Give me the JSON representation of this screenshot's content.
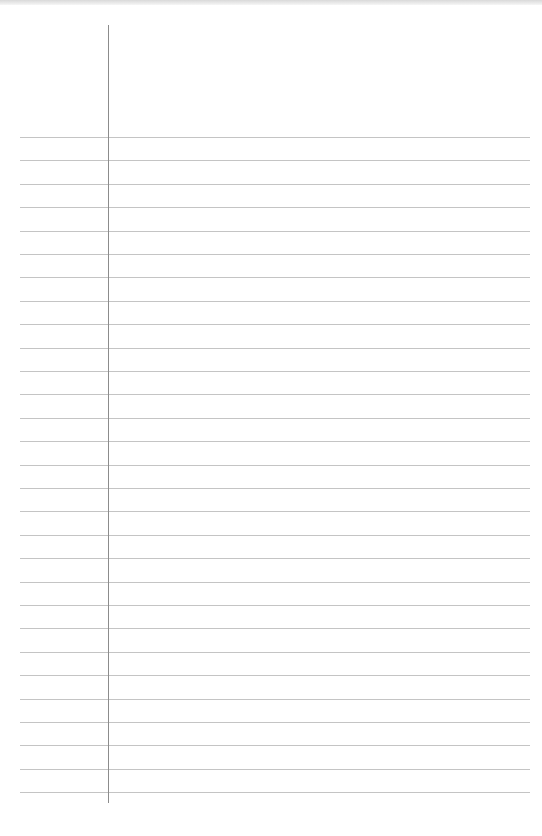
{
  "page": {
    "type": "lined-notebook-paper",
    "background_color": "#ffffff",
    "rule_color": "#c4c4c4",
    "margin_color": "#8c8c8c",
    "rules": {
      "count": 29,
      "first_y": 137,
      "spacing": 23.4,
      "x_start": 20,
      "x_end": 530
    },
    "margin_line": {
      "x": 108,
      "y_start": 25,
      "y_end": 803
    },
    "text": ""
  }
}
